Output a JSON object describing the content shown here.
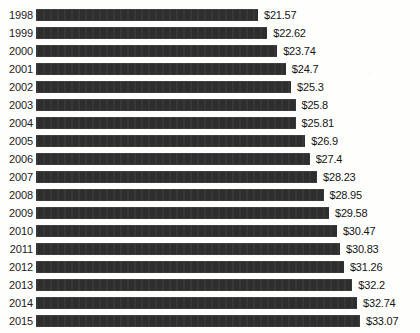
{
  "chart_data": {
    "type": "bar",
    "orientation": "horizontal",
    "title": "",
    "xlabel": "",
    "ylabel": "",
    "grid": false,
    "legend": null,
    "xlim": [
      0,
      33.07
    ],
    "categories": [
      "1998",
      "1999",
      "2000",
      "2001",
      "2002",
      "2003",
      "2004",
      "2005",
      "2006",
      "2007",
      "2008",
      "2009",
      "2010",
      "2011",
      "2012",
      "2013",
      "2014",
      "2015"
    ],
    "values": [
      21.57,
      22.62,
      23.74,
      24.7,
      25.3,
      25.8,
      25.81,
      26.9,
      27.4,
      28.23,
      28.95,
      29.58,
      30.47,
      30.83,
      31.26,
      32.2,
      32.74,
      33.07
    ],
    "value_labels": [
      "$21.57",
      "$22.62",
      "$23.74",
      "$24.7",
      "$25.3",
      "$25.8",
      "$25.81",
      "$26.9",
      "$27.4",
      "$28.23",
      "$28.95",
      "$29.58",
      "$30.47",
      "$30.83",
      "$31.26",
      "$32.2",
      "$32.74",
      "$33.07"
    ],
    "bar_color": "#2e2e2e",
    "text_color": "#141414",
    "background_color": "#fefefd",
    "rows": [
      {
        "year": "1998",
        "value": 21.57,
        "label": "$21.57"
      },
      {
        "year": "1999",
        "value": 22.62,
        "label": "$22.62"
      },
      {
        "year": "2000",
        "value": 23.74,
        "label": "$23.74"
      },
      {
        "year": "2001",
        "value": 24.7,
        "label": "$24.7"
      },
      {
        "year": "2002",
        "value": 25.3,
        "label": "$25.3"
      },
      {
        "year": "2003",
        "value": 25.8,
        "label": "$25.8"
      },
      {
        "year": "2004",
        "value": 25.81,
        "label": "$25.81"
      },
      {
        "year": "2005",
        "value": 26.9,
        "label": "$26.9"
      },
      {
        "year": "2006",
        "value": 27.4,
        "label": "$27.4"
      },
      {
        "year": "2007",
        "value": 28.23,
        "label": "$28.23"
      },
      {
        "year": "2008",
        "value": 28.95,
        "label": "$28.95"
      },
      {
        "year": "2009",
        "value": 29.58,
        "label": "$29.58"
      },
      {
        "year": "2010",
        "value": 30.47,
        "label": "$30.47"
      },
      {
        "year": "2011",
        "value": 30.83,
        "label": "$30.83"
      },
      {
        "year": "2012",
        "value": 31.26,
        "label": "$31.26"
      },
      {
        "year": "2013",
        "value": 32.2,
        "label": "$32.2"
      },
      {
        "year": "2014",
        "value": 32.74,
        "label": "$32.74"
      },
      {
        "year": "2015",
        "value": 33.07,
        "label": "$33.07"
      }
    ]
  },
  "render": {
    "bar_min_px": 222,
    "bar_max_px": 324,
    "value_min": 21.57,
    "value_max": 33.07
  }
}
